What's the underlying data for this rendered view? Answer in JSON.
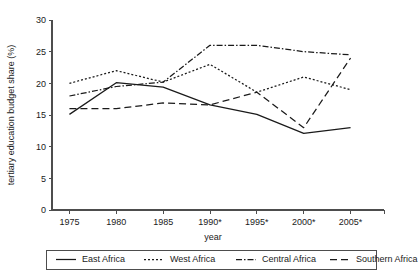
{
  "chart_data": {
    "type": "line",
    "title": "",
    "xlabel": "year",
    "ylabel": "tertiary education budget share (%)",
    "x": [
      "1975",
      "1980",
      "1985",
      "1990*",
      "1995*",
      "2000*",
      "2005*"
    ],
    "xtick_labels": [
      "1975",
      "1980",
      "1985",
      "1990*",
      "1995*",
      "2000*",
      "2005*"
    ],
    "ytick_labels": [
      "0",
      "5",
      "10",
      "15",
      "20",
      "25",
      "30"
    ],
    "ytick_values": [
      0,
      5,
      10,
      15,
      20,
      25,
      30
    ],
    "ylim": [
      0,
      30
    ],
    "grid": false,
    "legend_position": "bottom",
    "series": [
      {
        "name": "East Africa",
        "style": "solid",
        "dash": "none",
        "color": "#1a1a1a",
        "values": [
          15.1,
          20.1,
          19.4,
          16.6,
          15.1,
          12.1,
          13.0
        ]
      },
      {
        "name": "West Africa",
        "style": "dotted",
        "dash": "2,2",
        "color": "#1a1a1a",
        "values": [
          20.0,
          22.0,
          20.2,
          23.0,
          18.6,
          21.0,
          19.0
        ]
      },
      {
        "name": "Central Africa",
        "style": "dash-dot",
        "dash": "6,2,1.5,2",
        "color": "#1a1a1a",
        "values": [
          18.0,
          19.5,
          20.2,
          26.0,
          26.0,
          25.0,
          24.5
        ]
      },
      {
        "name": "Southern Africa",
        "style": "dashed",
        "dash": "7,4",
        "color": "#1a1a1a",
        "values": [
          16.0,
          16.0,
          16.9,
          16.6,
          18.6,
          13.0,
          24.0
        ]
      }
    ]
  },
  "legend": {
    "items": [
      {
        "label": "East Africa"
      },
      {
        "label": "West Africa"
      },
      {
        "label": "Central Africa"
      },
      {
        "label": "Southern Africa"
      }
    ]
  },
  "axes": {
    "x_title": "year",
    "y_title": "tertiary education budget share (%)"
  }
}
